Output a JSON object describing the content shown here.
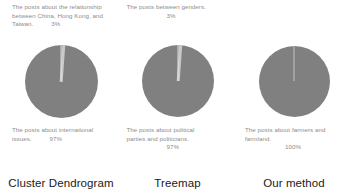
{
  "chart_data": {
    "type": "pie",
    "title": "",
    "legend": "none",
    "panels": [
      {
        "caption": "Cluster Dendrogram",
        "categories": [
          "The posts about the relationship between China, Hong Kong, and Taiwan.",
          "The posts about international issues."
        ],
        "values": [
          3,
          97
        ],
        "value_labels": [
          "3%",
          "97%"
        ],
        "colors": [
          "#c9c9c9",
          "#808080"
        ]
      },
      {
        "caption": "Treemap",
        "categories": [
          "The posts between genders.",
          "The posts about political parties and politicians."
        ],
        "values": [
          3,
          97
        ],
        "value_labels": [
          "3%",
          "97%"
        ],
        "colors": [
          "#c9c9c9",
          "#808080"
        ]
      },
      {
        "caption": "Our method",
        "categories": [
          "The posts about farmers and farmland."
        ],
        "values": [
          100
        ],
        "value_labels": [
          "100%"
        ],
        "colors": [
          "#808080"
        ]
      }
    ]
  },
  "panels": [
    {
      "caption": "Cluster Dendrogram",
      "top_label_line1": "The posts about the relationship",
      "top_label_line2": "between  China, Hong Kong, and",
      "top_label_line3": "Taiwan.",
      "top_percent": "3%",
      "bottom_label_line1": "The posts about international",
      "bottom_label_line2": "issues.",
      "bottom_percent": "97%"
    },
    {
      "caption": "Treemap",
      "top_label_line1": "The posts between genders.",
      "top_label_line2": "",
      "top_label_line3": "",
      "top_percent": "3%",
      "bottom_label_line1": "The posts about political",
      "bottom_label_line2": "parties and politicians.",
      "bottom_percent": "97%"
    },
    {
      "caption": "Our method",
      "top_label_line1": "",
      "top_label_line2": "",
      "top_label_line3": "",
      "top_percent": "",
      "bottom_label_line1": "The posts about farmers and",
      "bottom_label_line2": "farmland.",
      "bottom_percent": "100%"
    }
  ],
  "colors": {
    "major_slice": "#808080",
    "minor_slice": "#c9c9c9",
    "label_text": "#8d8d8d",
    "caption_text": "#1a1a1a",
    "background": "#ffffff"
  }
}
